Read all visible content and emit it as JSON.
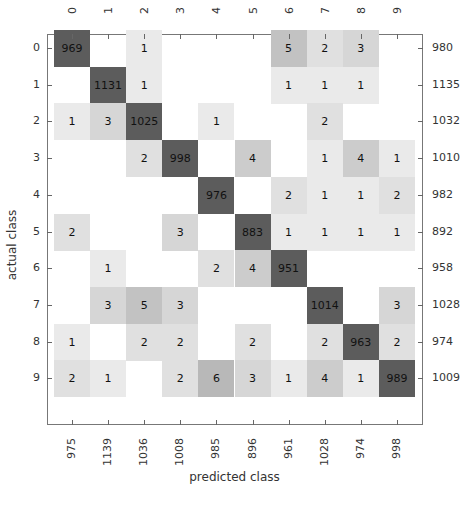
{
  "chart_data": {
    "type": "heatmap",
    "title": "",
    "xlabel": "predicted class",
    "ylabel": "actual class",
    "classes": [
      "0",
      "1",
      "2",
      "3",
      "4",
      "5",
      "6",
      "7",
      "8",
      "9"
    ],
    "matrix": [
      [
        969,
        0,
        1,
        0,
        0,
        0,
        5,
        2,
        3,
        0
      ],
      [
        0,
        1131,
        1,
        0,
        0,
        0,
        1,
        1,
        1,
        0
      ],
      [
        1,
        3,
        1025,
        0,
        1,
        0,
        0,
        2,
        0,
        0
      ],
      [
        0,
        0,
        2,
        998,
        0,
        4,
        0,
        1,
        4,
        1
      ],
      [
        0,
        0,
        0,
        0,
        976,
        0,
        2,
        1,
        1,
        2
      ],
      [
        2,
        0,
        0,
        3,
        0,
        883,
        1,
        1,
        1,
        1
      ],
      [
        0,
        1,
        0,
        0,
        2,
        4,
        951,
        0,
        0,
        0
      ],
      [
        0,
        3,
        5,
        3,
        0,
        0,
        0,
        1014,
        0,
        3
      ],
      [
        1,
        0,
        2,
        2,
        0,
        2,
        0,
        2,
        963,
        2
      ],
      [
        2,
        1,
        0,
        2,
        6,
        3,
        1,
        4,
        1,
        989
      ]
    ],
    "row_totals": [
      980,
      1135,
      1032,
      1010,
      982,
      892,
      958,
      1028,
      974,
      1009
    ],
    "column_totals": [
      975,
      1139,
      1036,
      1008,
      985,
      896,
      961,
      1028,
      974,
      998
    ],
    "top_tick_labels": [
      "0",
      "1",
      "2",
      "3",
      "4",
      "5",
      "6",
      "7",
      "8",
      "9"
    ],
    "left_tick_labels": [
      "0",
      "1",
      "2",
      "3",
      "4",
      "5",
      "6",
      "7",
      "8",
      "9"
    ],
    "colormap": "grayscale (white = 0, dark gray = high)",
    "zero_cells_labeled": false
  },
  "colors": {
    "background": "#ffffff",
    "frame": "#777777",
    "diag_cell": "#5a5a5a",
    "text": "#333333"
  }
}
